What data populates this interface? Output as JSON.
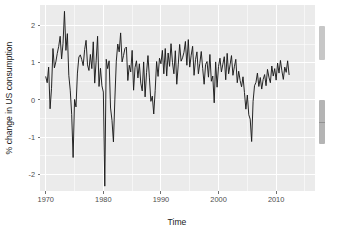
{
  "figure": {
    "background_color": "#ffffff",
    "panel_color": "#ebebeb",
    "grid_color": "#ffffff",
    "line_color": "#1a1a1a"
  },
  "scrollbar": {
    "upper_thumb_label": "scroll-thumb-upper",
    "lower_thumb_label": "scroll-thumb-lower"
  },
  "chart_data": {
    "type": "line",
    "title": "",
    "subtitle": "",
    "xlabel": "Time",
    "ylabel": "% change in US consumption",
    "xlim": [
      1969.0,
      2016.75
    ],
    "ylim": [
      -2.45,
      2.55
    ],
    "xticks": [
      1970,
      1980,
      1990,
      2000,
      2010
    ],
    "xticklabels": [
      "1970",
      "1980",
      "1990",
      "2000",
      "2010"
    ],
    "yticks": [
      -2,
      -1,
      0,
      1,
      2
    ],
    "yticklabels": [
      "-2",
      "-1",
      "0",
      "1",
      "2"
    ],
    "x_minor_ticks": [
      1975,
      1985,
      1995,
      2005,
      2015
    ],
    "y_minor_ticks": [
      -1.5,
      -0.5,
      0.5,
      1.5
    ],
    "grid": true,
    "legend": null,
    "legend_position": "none",
    "annotations": [],
    "series": [
      {
        "name": "Consumption",
        "x_start": 1970.0,
        "x_step": 0.25,
        "values": [
          0.62,
          0.46,
          0.88,
          -0.24,
          0.31,
          1.38,
          0.86,
          1.02,
          1.25,
          1.44,
          1.71,
          1.1,
          1.52,
          2.38,
          1.33,
          1.78,
          0.66,
          0.26,
          -0.39,
          -1.55,
          0.01,
          -0.19,
          0.72,
          1.15,
          1.21,
          1.08,
          0.92,
          1.35,
          1.6,
          0.94,
          0.79,
          1.22,
          0.84,
          1.56,
          0.45,
          1.05,
          1.71,
          0.36,
          0.85,
          0.38,
          0.21,
          -2.32,
          1.09,
          0.84,
          1.05,
          -0.22,
          -0.55,
          -1.13,
          0.02,
          1.04,
          1.5,
          1.29,
          1.8,
          1.02,
          1.19,
          1.38,
          1.42,
          0.52,
          0.93,
          0.75,
          1.33,
          0.26,
          0.87,
          1.05,
          0.59,
          0.97,
          0.45,
          0.24,
          1.02,
          0.08,
          0.73,
          1.19,
          0.59,
          -0.04,
          0.1,
          -0.38,
          0.25,
          1.03,
          0.63,
          1.12,
          0.97,
          1.33,
          0.7,
          1.38,
          0.64,
          1.26,
          0.9,
          1.51,
          1.01,
          0.7,
          1.32,
          0.42,
          0.94,
          1.49,
          1.04,
          1.13,
          1.28,
          1.57,
          0.93,
          1.62,
          0.88,
          1.2,
          1.44,
          0.66,
          1.08,
          1.29,
          0.7,
          0.98,
          1.3,
          0.84,
          0.42,
          0.95,
          1.03,
          0.61,
          1.22,
          0.5,
          0.64,
          -0.08,
          1.02,
          0.34,
          0.9,
          1.12,
          0.75,
          0.96,
          1.16,
          0.54,
          1.25,
          0.7,
          0.94,
          1.19,
          0.66,
          0.89,
          1.09,
          0.46,
          0.77,
          0.52,
          0.35,
          0.62,
          0.2,
          -0.25,
          0.13,
          -0.4,
          -0.52,
          -1.12,
          -0.04,
          0.38,
          0.47,
          0.72,
          0.36,
          0.6,
          0.29,
          0.55,
          0.68,
          0.38,
          0.82,
          0.61,
          0.46,
          0.91,
          0.64,
          0.84,
          0.53,
          0.99,
          0.72,
          1.06,
          0.78,
          0.55,
          0.88,
          0.74,
          1.05,
          0.68
        ]
      }
    ]
  }
}
